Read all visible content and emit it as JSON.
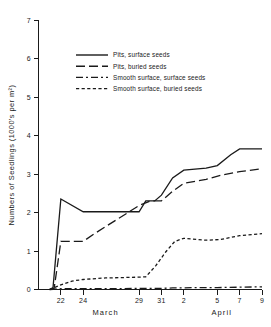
{
  "chart_data": {
    "type": "line",
    "title": "",
    "xlabel": "",
    "ylabel": "Numbers of Seedlings (1000's per m²)",
    "ylim": [
      0,
      7
    ],
    "yticks": [
      0,
      1,
      2,
      3,
      4,
      5,
      6,
      7
    ],
    "ytick_labels": [
      "0",
      "1",
      "2",
      "3",
      "4",
      "5",
      "6",
      "7"
    ],
    "xtick_labels": [
      "22",
      "24",
      "29",
      "31",
      "2",
      "5",
      "7",
      "9"
    ],
    "xtick_positions": [
      22,
      24,
      29,
      31,
      33,
      36,
      38,
      40
    ],
    "xlim": [
      20,
      40
    ],
    "grid": false,
    "legend_position": "upper-center",
    "month_labels": [
      {
        "text": "March",
        "x": 26
      },
      {
        "text": "April",
        "x": 36.4
      }
    ],
    "series": [
      {
        "name": "Pits, surface seeds",
        "style": "solid",
        "x": [
          21.0,
          21.3,
          22.0,
          24.0,
          29.0,
          29.6,
          30.4,
          31.0,
          32.0,
          33.0,
          35.0,
          36.0,
          37.2,
          38.0,
          40.0
        ],
        "values": [
          0.0,
          0.05,
          2.35,
          2.02,
          2.02,
          2.3,
          2.3,
          2.45,
          2.9,
          3.1,
          3.15,
          3.22,
          3.5,
          3.65,
          3.65
        ]
      },
      {
        "name": "Pits, buried seeds",
        "style": "long-dash",
        "x": [
          21.0,
          21.4,
          22.0,
          24.0,
          25.0,
          29.0,
          30.0,
          31.0,
          32.0,
          33.0,
          35.0,
          36.5,
          38.0,
          40.0
        ],
        "values": [
          0.0,
          0.03,
          1.25,
          1.25,
          1.45,
          2.18,
          2.3,
          2.3,
          2.55,
          2.76,
          2.86,
          2.98,
          3.06,
          3.14
        ]
      },
      {
        "name": "Smooth surface, surface seeds",
        "style": "dash-dot-dash",
        "x": [
          21.0,
          22.0,
          24.0,
          27.0,
          29.0,
          30.0,
          31.0,
          32.0,
          33.0,
          34.0,
          36.0,
          38.0,
          40.0
        ],
        "values": [
          0.0,
          0.02,
          0.02,
          0.02,
          0.03,
          0.03,
          0.03,
          0.04,
          0.04,
          0.05,
          0.05,
          0.06,
          0.07
        ]
      },
      {
        "name": "Smooth surface, buried seeds",
        "style": "short-dash",
        "x": [
          21.0,
          22.0,
          23.0,
          24.0,
          26.0,
          29.0,
          29.6,
          30.5,
          31.4,
          32.2,
          33.0,
          35.0,
          36.3,
          38.0,
          40.0
        ],
        "values": [
          0.0,
          0.12,
          0.22,
          0.26,
          0.3,
          0.32,
          0.33,
          0.62,
          0.98,
          1.25,
          1.33,
          1.28,
          1.3,
          1.4,
          1.45
        ]
      }
    ],
    "legend_entries": [
      {
        "label": "Pits, surface seeds",
        "style": "solid"
      },
      {
        "label": "Pits, buried seeds",
        "style": "long-dash"
      },
      {
        "label": "Smooth surface, surface seeds",
        "style": "dash-dot-dash"
      },
      {
        "label": "Smooth surface, buried seeds",
        "style": "short-dash"
      }
    ]
  }
}
